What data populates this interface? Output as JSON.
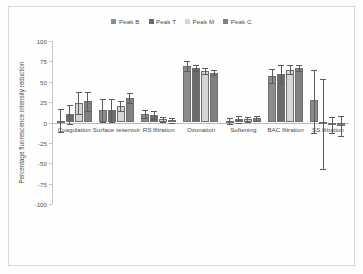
{
  "figure": {
    "background": "#fefefe",
    "frame_color": "#d9d9d9"
  },
  "chart_data": {
    "type": "bar",
    "title": "",
    "subtitle": "",
    "xlabel": "",
    "ylabel": "Percentage fluorescence intensity reduction",
    "ylim": [
      -100,
      100
    ],
    "yticks": [
      100,
      75,
      50,
      25,
      0,
      -25,
      -50,
      -75,
      -100
    ],
    "ytick_labels": [
      "100",
      "75",
      "50",
      "25",
      "0",
      "-25",
      "-50",
      "-75",
      "-100"
    ],
    "grid": false,
    "legend_position": "top-center",
    "categories": [
      "Coagulation",
      "Surface reservoir",
      "RS filtration",
      "Ozonation",
      "Softening",
      "BAC filtration",
      "SS filtration"
    ],
    "series": [
      {
        "name": "Peak B",
        "color": "#8c8c8c",
        "values": [
          2,
          15,
          10,
          69,
          2,
          57,
          28
        ],
        "err_up": [
          14,
          14,
          5,
          6,
          4,
          9,
          36
        ],
        "err_down": [
          14,
          14,
          5,
          6,
          4,
          9,
          41
        ]
      },
      {
        "name": "Peak T",
        "color": "#6b6b6b",
        "values": [
          10,
          15,
          9,
          67,
          4,
          59,
          1
        ],
        "err_up": [
          12,
          14,
          5,
          4,
          4,
          11,
          52
        ],
        "err_down": [
          12,
          14,
          5,
          4,
          4,
          11,
          58
        ]
      },
      {
        "name": "Peak M",
        "color": "#d6d6d6",
        "values": [
          24,
          20,
          4,
          63,
          4,
          65,
          -3
        ],
        "err_up": [
          13,
          6,
          3,
          4,
          3,
          5,
          10
        ],
        "err_down": [
          13,
          6,
          3,
          4,
          3,
          5,
          10
        ]
      },
      {
        "name": "Peak C",
        "color": "#808080",
        "values": [
          26,
          30,
          3,
          61,
          5,
          67,
          -4
        ],
        "err_up": [
          12,
          6,
          3,
          3,
          3,
          4,
          12
        ],
        "err_down": [
          12,
          6,
          3,
          3,
          3,
          4,
          12
        ]
      }
    ]
  }
}
